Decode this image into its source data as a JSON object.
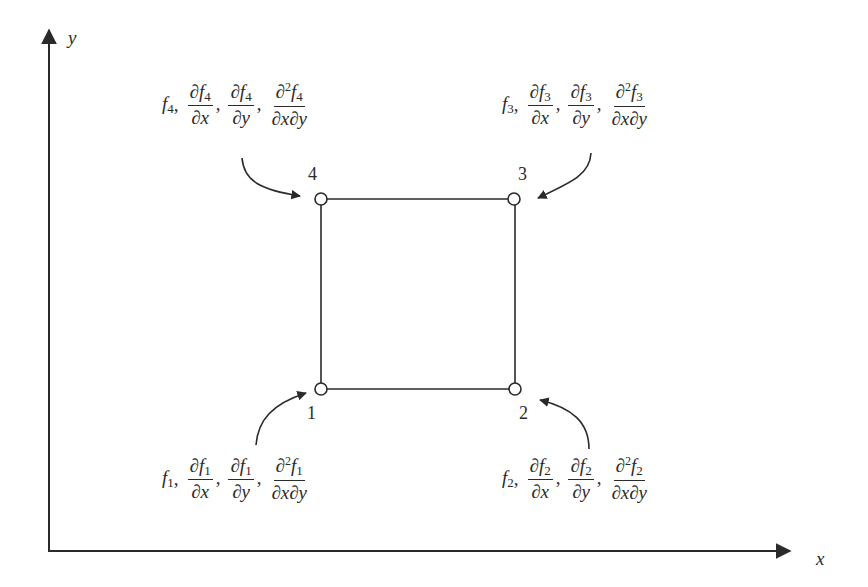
{
  "axes": {
    "x_label": "x",
    "y_label": "y",
    "origin": [
      49,
      551
    ],
    "x_end": [
      793,
      551
    ],
    "y_end": [
      49,
      27
    ]
  },
  "element": {
    "nodes": [
      {
        "id": "1",
        "label": "1",
        "pos": [
          321,
          389
        ]
      },
      {
        "id": "2",
        "label": "2",
        "pos": [
          515,
          389
        ]
      },
      {
        "id": "3",
        "label": "3",
        "pos": [
          514,
          199
        ]
      },
      {
        "id": "4",
        "label": "4",
        "pos": [
          321,
          199
        ]
      }
    ]
  },
  "node_dofs": [
    {
      "node": "1",
      "f": "f",
      "sub": "1",
      "partial": "∂",
      "dx": "∂x",
      "dy": "∂y",
      "dxdy": "∂x∂y",
      "second": "2"
    },
    {
      "node": "2",
      "f": "f",
      "sub": "2",
      "partial": "∂",
      "dx": "∂x",
      "dy": "∂y",
      "dxdy": "∂x∂y",
      "second": "2"
    },
    {
      "node": "3",
      "f": "f",
      "sub": "3",
      "partial": "∂",
      "dx": "∂x",
      "dy": "∂y",
      "dxdy": "∂x∂y",
      "second": "2"
    },
    {
      "node": "4",
      "f": "f",
      "sub": "4",
      "partial": "∂",
      "dx": "∂x",
      "dy": "∂y",
      "dxdy": "∂x∂y",
      "second": "2"
    }
  ],
  "punct": {
    "comma": ","
  },
  "colors": {
    "ink": "#2a2a2a",
    "background": "#ffffff"
  }
}
